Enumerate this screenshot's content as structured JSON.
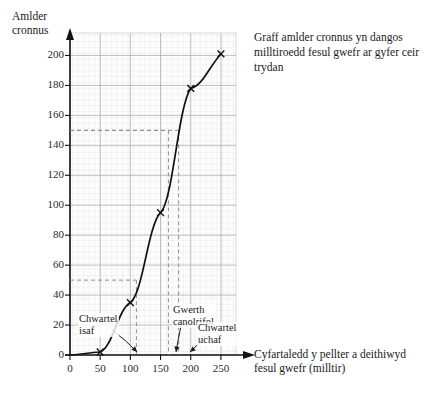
{
  "chart_data": {
    "type": "line",
    "title": "Graff amlder cronnus yn dangos milltiroedd fesul gwefr ar gyfer ceir trydan",
    "xlabel": "Cyfartaledd y pellter a deithiwyd fesul gwefr (milltir)",
    "ylabel": "Amlder cronnus",
    "xlim": [
      0,
      275
    ],
    "ylim": [
      0,
      215
    ],
    "xticks": [
      0,
      50,
      100,
      150,
      200,
      250
    ],
    "yticks": [
      0,
      20,
      40,
      60,
      80,
      100,
      120,
      140,
      160,
      180,
      200
    ],
    "grid": true,
    "legend": "none",
    "series": [
      {
        "name": "Amlder cronnus",
        "marker": "x",
        "x": [
          50,
          100,
          150,
          200,
          250
        ],
        "y": [
          2,
          35,
          95,
          178,
          201
        ]
      }
    ],
    "annotations": [
      {
        "label": "Chwartel\nisaf",
        "value": 50,
        "x_at_curve": 110
      },
      {
        "label": "Gwerth\ncanolrifol",
        "value": 150,
        "x_at_curve": 163
      },
      {
        "label": "Chwartel\nuchaf",
        "value": 150,
        "x_at_curve": 180
      }
    ],
    "guide_lines": [
      {
        "name": "lower-quartile",
        "y": 50,
        "x": 110
      },
      {
        "name": "median",
        "y": 150,
        "x": 163
      },
      {
        "name": "upper-quartile",
        "y": 150,
        "x": 180
      }
    ]
  },
  "labels": {
    "y_axis_title": "Amlder\ncronnus",
    "x_axis_title": "Cyfartaledd y pellter a deithiwyd\nfesul gwefr (milltir)",
    "caption": "Graff amlder cronnus yn dangos milltiroedd fesul gwefr ar gyfer ceir trydan",
    "annot_lower_quartile": "Chwartel\nisaf",
    "annot_median": "Gwerth\ncanolrifol",
    "annot_upper_quartile": "Chwartel\nuchaf"
  },
  "ytick_labels": [
    "200",
    "180",
    "160",
    "140",
    "120",
    "100",
    "80",
    "60",
    "40",
    "20",
    "0"
  ],
  "xtick_labels": [
    "0",
    "50",
    "100",
    "150",
    "200",
    "250"
  ],
  "colors": {
    "curve": "#111111",
    "grid_minor": "#d8d8d8",
    "grid_major": "#aaaaaa",
    "axis": "#111111",
    "guide": "#8a8a8a",
    "plot_bg": "#fdfdfd"
  }
}
